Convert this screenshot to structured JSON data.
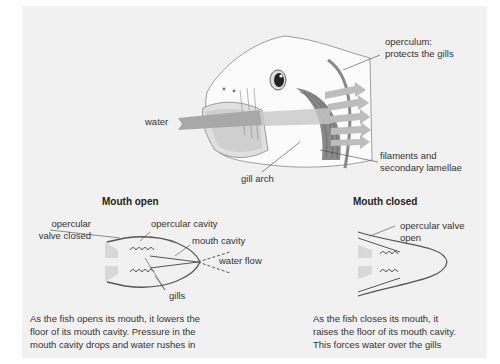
{
  "fish_head": {
    "labels": {
      "operculum": [
        "operculum:",
        "protects the gills"
      ],
      "water": "water",
      "filaments": [
        "filaments and",
        "secondary lamellae"
      ],
      "gill_arch": "gill arch"
    }
  },
  "mouth_open": {
    "title": "Mouth open",
    "labels": {
      "opercular_valve": [
        "opercular",
        "valve closed"
      ],
      "opercular_cavity": "opercular cavity",
      "mouth_cavity": "mouth cavity",
      "water_flow": "water flow",
      "gills": "gills"
    },
    "caption": [
      "As the fish opens its mouth, it lowers the",
      "floor of its mouth cavity. Pressure in the",
      "mouth cavity drops and water rushes in"
    ]
  },
  "mouth_closed": {
    "title": "Mouth closed",
    "labels": {
      "opercular_valve": [
        "opercular valve",
        "open"
      ]
    },
    "caption": [
      "As the fish closes its mouth, it",
      "raises the floor of its mouth cavity.",
      "This forces water over the gills"
    ]
  },
  "colors": {
    "panel": "#f1f1f1",
    "arrow": "#9a9a9a",
    "arrow_light": "#c4c4c4",
    "gill": "#7a7a7a",
    "outline": "#555555"
  }
}
